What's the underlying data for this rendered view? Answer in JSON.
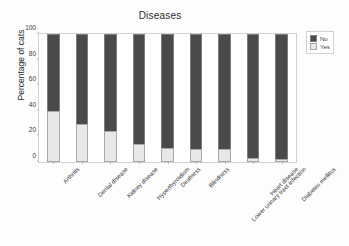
{
  "chart_data": {
    "type": "bar",
    "subtype": "stacked-bar-100-percent",
    "title": "Diseases",
    "xlabel": "",
    "ylabel": "Percentage of cats",
    "ylim": [
      0,
      100
    ],
    "yticks": [
      0,
      20,
      40,
      60,
      80,
      100
    ],
    "grid": false,
    "legend_position": "upper-right-outside",
    "categories": [
      "Arthritis",
      "Dental disease",
      "Kidney disease",
      "Hyperthyroidism",
      "Deafness",
      "Blindness",
      "Lower urinary tract infection",
      "Heart disease",
      "Diabetes mellitus"
    ],
    "series": [
      {
        "name": "Yes",
        "color": "#e8e8e8",
        "values": [
          40,
          30,
          24,
          14,
          11,
          10,
          10,
          3,
          2
        ]
      },
      {
        "name": "No",
        "color": "#4a4a4a",
        "values": [
          60,
          70,
          76,
          86,
          89,
          90,
          90,
          97,
          98
        ]
      }
    ]
  },
  "legend": {
    "entries": [
      {
        "label": "No",
        "color": "#4a4a4a"
      },
      {
        "label": "Yes",
        "color": "#e8e8e8"
      }
    ]
  }
}
